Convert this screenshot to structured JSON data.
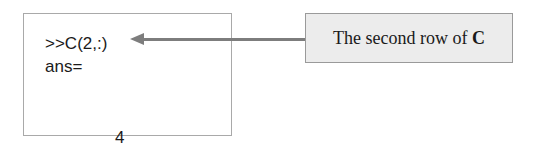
{
  "console": {
    "command": ">>C(2,:)",
    "answer_label": "ans=",
    "values": [
      "4",
      "10",
      "-2"
    ]
  },
  "annotation": {
    "text_prefix": "The second row of ",
    "text_bold": "C"
  },
  "colors": {
    "box_border": "#a9a9a9",
    "arrow": "#7d7d7d",
    "label_fill": "#ececec",
    "text": "#1a1a1a"
  }
}
